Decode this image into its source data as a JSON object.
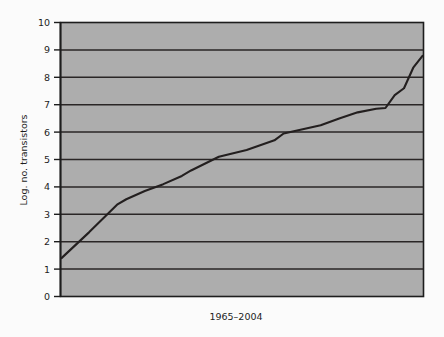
{
  "chart_data": {
    "type": "line",
    "title": "",
    "subtitle": "",
    "xlabel": "1965–2004",
    "ylabel": "Log. no. transistors",
    "xlim": [
      1965,
      2004
    ],
    "ylim": [
      0,
      10
    ],
    "grid": true,
    "legend": false,
    "legend_position": "none",
    "y_ticks": [
      "10",
      "9",
      "8",
      "7",
      "6",
      "5",
      "4",
      "3",
      "2",
      "1",
      "0"
    ],
    "y_tick_values": [
      10,
      9,
      8,
      7,
      6,
      5,
      4,
      3,
      2,
      1,
      0
    ],
    "x_ticks": [],
    "gridlines_at": [
      9,
      8,
      7,
      6,
      5,
      4,
      3,
      2,
      1
    ],
    "series": [
      {
        "name": "Log. no. transistors",
        "x": [
          1965,
          1968,
          1971,
          1972,
          1974,
          1976,
          1978,
          1979,
          1982,
          1985,
          1988,
          1989,
          1993,
          1995,
          1997,
          1999,
          2000,
          2001,
          2002,
          2003,
          2004
        ],
        "values": [
          1.4,
          2.35,
          3.35,
          3.55,
          3.85,
          4.1,
          4.4,
          4.6,
          5.1,
          5.35,
          5.7,
          5.95,
          6.25,
          6.5,
          6.72,
          6.85,
          6.88,
          7.35,
          7.6,
          8.35,
          8.78
        ]
      }
    ],
    "colors": {
      "plot_background": "#adadad",
      "page_background": "#fbfbfb",
      "line": "#231f1f",
      "gridline": "#2a2626",
      "axis": "#1d1d1d",
      "text": "#1d1d1d"
    },
    "notes": {
      "annotations": [],
      "plateau_1_value": 6.85,
      "plateau_2_value": 7.6,
      "start_value": 1.4,
      "end_value": 8.78
    }
  },
  "figure": {
    "x_axis_label": "1965–2004",
    "y_axis_title": "Log. no. transistors"
  }
}
